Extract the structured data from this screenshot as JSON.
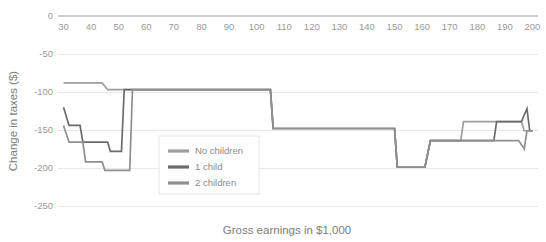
{
  "chart_data": {
    "type": "line",
    "title": "",
    "xlabel": "Gross earnings in $1,000",
    "ylabel": "Change in taxes ($)",
    "xlim": [
      28,
      202
    ],
    "ylim": [
      -250,
      0
    ],
    "grid": true,
    "legend_position": "center-left-inside",
    "x_ticks": [
      30,
      40,
      50,
      60,
      70,
      80,
      90,
      100,
      110,
      120,
      130,
      140,
      150,
      160,
      170,
      180,
      190,
      200
    ],
    "y_ticks": [
      0,
      -50,
      -100,
      -150,
      -200,
      -250
    ],
    "x_tick_labels": [
      "30",
      "40",
      "50",
      "60",
      "70",
      "80",
      "90",
      "100",
      "110",
      "120",
      "130",
      "140",
      "150",
      "160",
      "170",
      "180",
      "190",
      "200"
    ],
    "y_tick_labels": [
      "0",
      "-50",
      "-100",
      "-150",
      "-200",
      "-250"
    ],
    "series": [
      {
        "name": "No children",
        "color": "#9e9e9e",
        "points": [
          [
            30,
            -88
          ],
          [
            44,
            -88
          ],
          [
            46,
            -97
          ],
          [
            105,
            -97
          ],
          [
            106,
            -148
          ],
          [
            150,
            -148
          ],
          [
            151,
            -199
          ],
          [
            161,
            -199
          ],
          [
            163,
            -164
          ],
          [
            174,
            -164
          ],
          [
            175,
            -139
          ],
          [
            196,
            -139
          ],
          [
            197,
            -151
          ],
          [
            200,
            -151
          ]
        ]
      },
      {
        "name": "1 child",
        "color": "#6b6b6b",
        "points": [
          [
            30,
            -120
          ],
          [
            32,
            -144
          ],
          [
            36,
            -144
          ],
          [
            37,
            -166
          ],
          [
            46,
            -166
          ],
          [
            47,
            -178
          ],
          [
            51,
            -178
          ],
          [
            52,
            -97
          ],
          [
            105,
            -97
          ],
          [
            106,
            -148
          ],
          [
            150,
            -148
          ],
          [
            151,
            -199
          ],
          [
            161,
            -199
          ],
          [
            163,
            -164
          ],
          [
            186,
            -164
          ],
          [
            187,
            -139
          ],
          [
            196,
            -139
          ],
          [
            198,
            -122
          ],
          [
            199,
            -151
          ],
          [
            200,
            -151
          ]
        ]
      },
      {
        "name": "2 children",
        "color": "#8f8f8f",
        "points": [
          [
            30,
            -144
          ],
          [
            32,
            -166
          ],
          [
            37,
            -166
          ],
          [
            38,
            -192
          ],
          [
            44,
            -192
          ],
          [
            45,
            -203
          ],
          [
            54,
            -203
          ],
          [
            55,
            -97
          ],
          [
            105,
            -97
          ],
          [
            106,
            -148
          ],
          [
            150,
            -148
          ],
          [
            151,
            -199
          ],
          [
            161,
            -199
          ],
          [
            163,
            -164
          ],
          [
            195,
            -164
          ],
          [
            197,
            -175
          ],
          [
            198,
            -151
          ],
          [
            200,
            -151
          ]
        ]
      }
    ]
  },
  "legend": {
    "entries": [
      {
        "label": "No children",
        "color": "#9e9e9e"
      },
      {
        "label": "1 child",
        "color": "#6b6b6b"
      },
      {
        "label": "2 children",
        "color": "#8f8f8f"
      }
    ]
  }
}
